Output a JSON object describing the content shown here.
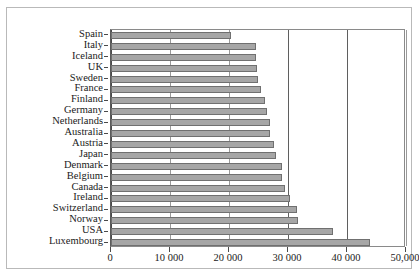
{
  "chart_data": {
    "type": "bar",
    "orientation": "horizontal",
    "title": "",
    "subtitle": "",
    "xlabel": "",
    "ylabel": "",
    "xlim": [
      0,
      50000
    ],
    "grid": true,
    "legend": null,
    "categories": [
      "Spain",
      "Italy",
      "Iceland",
      "UK",
      "Sweden",
      "France",
      "Finland",
      "Germany",
      "Netherlands",
      "Australia",
      "Austria",
      "Japan",
      "Denmark",
      "Belgium",
      "Canada",
      "Ireland",
      "Switzerland",
      "Norway",
      "USA",
      "Luxembourg"
    ],
    "values": [
      20400,
      24500,
      24500,
      24800,
      24900,
      25500,
      26100,
      26400,
      27000,
      27000,
      27700,
      28000,
      29000,
      29000,
      29500,
      30400,
      31500,
      31700,
      37600,
      43900
    ],
    "xticks": [
      0,
      10000,
      20000,
      30000,
      40000,
      50000
    ],
    "xticklabels": [
      "0",
      "10 000",
      "20 000",
      "30 000",
      "40 000",
      "50,000"
    ],
    "bar_color": "#a6a6a6",
    "bar_border_color": "#707070",
    "gridline_color": "#9a9a9a",
    "frame_color": "#8a8a8a"
  }
}
